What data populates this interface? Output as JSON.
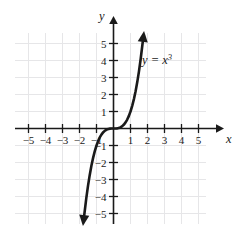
{
  "chart_data": {
    "type": "line",
    "title": "",
    "subtitle": "",
    "xlabel": "x",
    "ylabel": "y",
    "xlim": [
      -6,
      6
    ],
    "ylim": [
      -6,
      6
    ],
    "grid": true,
    "legend_position": "none",
    "annotations": [
      {
        "name": "curve-equation-label",
        "text": "y = x",
        "exponent": "3",
        "full_text": "y = x^3",
        "x": 2.0,
        "y": 4.3
      }
    ],
    "series": [
      {
        "name": "y = x^3",
        "equation": "y = x^3",
        "color": "#1a1a1a",
        "arrow_start": true,
        "arrow_end": true,
        "x": [
          -1.72,
          -1.6,
          -1.5,
          -1.4,
          -1.3,
          -1.2,
          -1.1,
          -1.0,
          -0.9,
          -0.8,
          -0.7,
          -0.6,
          -0.5,
          -0.4,
          -0.3,
          -0.2,
          -0.1,
          0.0,
          0.1,
          0.2,
          0.3,
          0.4,
          0.5,
          0.6,
          0.7,
          0.8,
          0.9,
          1.0,
          1.1,
          1.2,
          1.3,
          1.4,
          1.5,
          1.6,
          1.72
        ],
        "y": [
          -5.09,
          -4.1,
          -3.375,
          -2.744,
          -2.197,
          -1.728,
          -1.331,
          -1.0,
          -0.729,
          -0.512,
          -0.343,
          -0.216,
          -0.125,
          -0.064,
          -0.027,
          -0.008,
          -0.001,
          0.0,
          0.001,
          0.008,
          0.027,
          0.064,
          0.125,
          0.216,
          0.343,
          0.512,
          0.729,
          1.0,
          1.331,
          1.728,
          2.197,
          2.744,
          3.375,
          4.1,
          5.09
        ]
      }
    ],
    "x_ticks": [
      {
        "value": -5,
        "label": "−5"
      },
      {
        "value": -4,
        "label": "−4"
      },
      {
        "value": -3,
        "label": "−3"
      },
      {
        "value": -2,
        "label": "−2"
      },
      {
        "value": -1,
        "label": "−1"
      },
      {
        "value": 1,
        "label": "1"
      },
      {
        "value": 2,
        "label": "2"
      },
      {
        "value": 3,
        "label": "3"
      },
      {
        "value": 4,
        "label": "4"
      },
      {
        "value": 5,
        "label": "5"
      }
    ],
    "y_ticks": [
      {
        "value": 5,
        "label": "5"
      },
      {
        "value": 4,
        "label": "4"
      },
      {
        "value": 3,
        "label": "3"
      },
      {
        "value": 2,
        "label": "2"
      },
      {
        "value": 1,
        "label": "1"
      },
      {
        "value": -1,
        "label": "−1"
      },
      {
        "value": -2,
        "label": "−2"
      },
      {
        "value": -3,
        "label": "−3"
      },
      {
        "value": -4,
        "label": "−4"
      },
      {
        "value": -5,
        "label": "−5"
      }
    ],
    "colors": {
      "curve": "#1a1a1a",
      "axis": "#1a1a1a",
      "grid": "#e6e6e8",
      "background": "#ffffff",
      "text": "#1a1a1a"
    }
  }
}
